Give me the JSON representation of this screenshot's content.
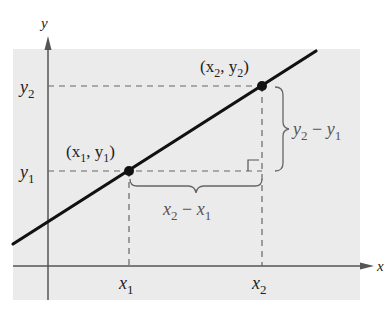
{
  "diagram": {
    "axes": {
      "x_label": "x",
      "y_label": "y"
    },
    "points": [
      {
        "name": "point-1",
        "label": "(x",
        "sub_x": "1",
        "mid": ", y",
        "sub_y": "1",
        "close": ")"
      },
      {
        "name": "point-2",
        "label": "(x",
        "sub_x": "2",
        "mid": ", y",
        "sub_y": "2",
        "close": ")"
      }
    ],
    "tick_labels": {
      "x1": {
        "base": "x",
        "sub": "1"
      },
      "x2": {
        "base": "x",
        "sub": "2"
      },
      "y1": {
        "base": "y",
        "sub": "1"
      },
      "y2": {
        "base": "y",
        "sub": "2"
      }
    },
    "rise_label": {
      "a": "y",
      "a_sub": "2",
      "op": " − ",
      "b": "y",
      "b_sub": "1"
    },
    "run_label": {
      "a": "x",
      "a_sub": "2",
      "op": " − ",
      "b": "x",
      "b_sub": "1"
    },
    "colors": {
      "background": "#ebebeb",
      "line": "#111111",
      "axis": "#555555",
      "dashed": "#666666",
      "brace": "#666666"
    }
  }
}
